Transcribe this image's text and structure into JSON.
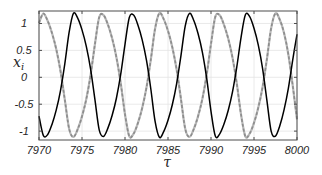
{
  "chart_data": {
    "type": "line",
    "title": "",
    "xlabel": "τ",
    "ylabel": "x_i",
    "ylabel_base": "x",
    "ylabel_sub": "i",
    "xlim": [
      7970,
      8000
    ],
    "ylim": [
      -1.165,
      1.232
    ],
    "grid": true,
    "legend": null,
    "xticks": [
      7970,
      7975,
      7980,
      7985,
      7990,
      7995,
      8000
    ],
    "xtick_labels": [
      "7970",
      "7975",
      "7980",
      "7985",
      "7990",
      "7995",
      "8000"
    ],
    "yticks": [
      -1,
      -0.5,
      0,
      0.5,
      1
    ],
    "ytick_labels": [
      "-1",
      "-0.5",
      "0",
      "0.5",
      "1"
    ],
    "x": [
      7970.0,
      7970.5,
      7971.0,
      7971.5,
      7972.0,
      7972.5,
      7973.0,
      7973.5,
      7974.0,
      7974.5,
      7975.0,
      7975.5,
      7976.0,
      7976.5,
      7977.0,
      7977.5,
      7978.0,
      7978.5,
      7979.0,
      7979.5,
      7980.0,
      7980.5,
      7981.0,
      7981.5,
      7982.0,
      7982.5,
      7983.0,
      7983.5,
      7984.0,
      7984.5,
      7985.0,
      7985.5,
      7986.0,
      7986.5,
      7987.0,
      7987.5,
      7988.0,
      7988.5,
      7989.0,
      7989.5,
      7990.0,
      7990.5,
      7991.0,
      7991.5,
      7992.0,
      7992.5,
      7993.0,
      7993.5,
      7994.0,
      7994.5,
      7995.0,
      7995.5,
      7996.0,
      7996.5,
      7997.0,
      7997.5,
      7998.0,
      7998.5,
      7999.0,
      7999.5,
      8000.0
    ],
    "series": [
      {
        "name": "gray",
        "color": "#9a9a9a",
        "style": "dashed",
        "values": [
          1.009,
          1.184,
          1.052,
          0.828,
          0.526,
          0.117,
          -0.414,
          -0.954,
          -1.108,
          -0.965,
          -0.726,
          -0.403,
          0.042,
          0.61,
          1.116,
          1.157,
          0.985,
          0.726,
          0.374,
          -0.106,
          -0.687,
          -1.097,
          -1.048,
          -0.85,
          -0.569,
          -0.188,
          0.327,
          0.906,
          1.191,
          1.081,
          0.862,
          0.56,
          0.149,
          -0.395,
          -0.954,
          -1.107,
          -0.961,
          -0.721,
          -0.396,
          0.052,
          0.622,
          1.123,
          1.155,
          0.98,
          0.72,
          0.366,
          -0.117,
          -0.699,
          -1.1,
          -1.045,
          -0.845,
          -0.563,
          -0.179,
          0.339,
          0.917,
          1.19,
          1.07,
          0.82,
          0.42,
          -0.15,
          -0.78
        ]
      },
      {
        "name": "black",
        "color": "#000000",
        "style": "solid",
        "values": [
          -0.72,
          -1.079,
          -1.066,
          -0.88,
          -0.611,
          -0.246,
          0.249,
          0.834,
          1.189,
          1.1,
          0.881,
          0.575,
          0.152,
          -0.411,
          -0.976,
          -1.099,
          -0.949,
          -0.71,
          -0.389,
          0.053,
          0.613,
          1.111,
          1.157,
          0.973,
          0.696,
          0.314,
          -0.213,
          -0.821,
          -1.116,
          -1.008,
          -0.798,
          -0.51,
          -0.12,
          0.395,
          0.951,
          1.189,
          1.056,
          0.808,
          0.464,
          -0.02,
          -0.632,
          -1.092,
          -1.056,
          -0.874,
          -0.618,
          -0.272,
          0.193,
          0.748,
          1.162,
          1.126,
          0.91,
          0.598,
          0.162,
          -0.428,
          -1.005,
          -1.091,
          -0.9,
          -0.6,
          -0.2,
          0.32,
          0.8
        ]
      }
    ],
    "colors": {
      "axes": "#4d4d4d",
      "grid": "#e4e4e4",
      "gray_under": "#b8b8b8",
      "gray_dash": "#8c8c8c"
    }
  }
}
